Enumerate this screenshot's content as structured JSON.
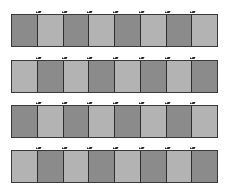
{
  "diagram": {
    "colors": {
      "dark": "#8b8b8b",
      "light": "#b3b3b3",
      "border": "#2e2e2e",
      "background": "#ffffff"
    },
    "strips": [
      {
        "top": 14,
        "cells": [
          "dark",
          "light",
          "dark",
          "light",
          "dark",
          "light",
          "dark",
          "light"
        ]
      },
      {
        "top": 60,
        "cells": [
          "light",
          "dark",
          "light",
          "dark",
          "light",
          "dark",
          "light",
          "dark"
        ]
      },
      {
        "top": 105,
        "cells": [
          "dark",
          "light",
          "dark",
          "light",
          "dark",
          "light",
          "dark",
          "light"
        ]
      },
      {
        "top": 150,
        "cells": [
          "light",
          "dark",
          "light",
          "dark",
          "light",
          "dark",
          "light",
          "dark"
        ]
      }
    ],
    "cells_per_strip": 8,
    "strip_count": 4
  }
}
